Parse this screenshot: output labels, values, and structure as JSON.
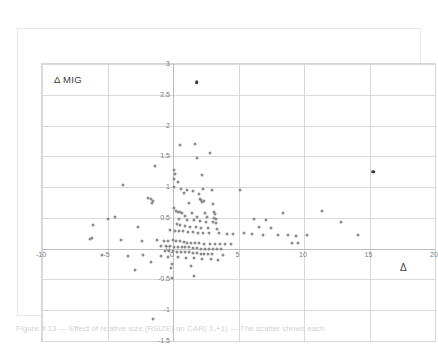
{
  "figure": {
    "caption": "Figure 4.13 — Effect of relative size (RSIZE) on CAR(-1,+1) — The scatter shows each"
  },
  "axes": {
    "y_title": "Δ MIG",
    "x_title": "Δ",
    "x_ticks": [
      "-10",
      "-5",
      "0",
      "5",
      "10",
      "15",
      "20"
    ],
    "y_ticks": [
      "3",
      "2.5",
      "2",
      "1.5",
      "1",
      "0.5",
      "0",
      "-0.5",
      "-1",
      "-1.5"
    ]
  },
  "chart_data": {
    "type": "scatter",
    "title": "",
    "xlabel": "Δ",
    "ylabel": "Δ MIG",
    "xlim": [
      -10,
      20
    ],
    "ylim": [
      -1.5,
      3
    ],
    "xticks": [
      -10,
      -5,
      0,
      5,
      10,
      15,
      20
    ],
    "yticks": [
      -1.5,
      -1,
      -0.5,
      0,
      0.5,
      1,
      1.5,
      2,
      2.5,
      3
    ],
    "grid": true,
    "legend": false,
    "marker_color": "#8c8c8c",
    "highlight_color": "#3a3a3a",
    "series": [
      {
        "name": "observations",
        "points": [
          [
            1.8,
            2.7
          ],
          [
            15.3,
            1.25
          ],
          [
            0.55,
            1.68
          ],
          [
            1.7,
            1.7
          ],
          [
            2.8,
            1.55
          ],
          [
            1.8,
            1.48
          ],
          [
            -1.4,
            1.35
          ],
          [
            0.1,
            1.28
          ],
          [
            0.15,
            1.22
          ],
          [
            0.1,
            1.13
          ],
          [
            2.2,
            1.2
          ],
          [
            0.4,
            1.08
          ],
          [
            -3.8,
            1.03
          ],
          [
            0.05,
            1.0
          ],
          [
            0.6,
            0.97
          ],
          [
            1.1,
            0.95
          ],
          [
            2.3,
            0.97
          ],
          [
            2.95,
            0.95
          ],
          [
            5.1,
            0.95
          ],
          [
            1.55,
            0.93
          ],
          [
            0.85,
            0.9
          ],
          [
            1.95,
            0.88
          ],
          [
            -1.9,
            0.82
          ],
          [
            -1.7,
            0.8
          ],
          [
            -1.55,
            0.78
          ],
          [
            -1.6,
            0.74
          ],
          [
            2.05,
            0.8
          ],
          [
            2.15,
            0.79
          ],
          [
            2.35,
            0.78
          ],
          [
            2.25,
            0.76
          ],
          [
            1.2,
            0.75
          ],
          [
            3.05,
            0.72
          ],
          [
            0.05,
            0.66
          ],
          [
            0.2,
            0.62
          ],
          [
            0.35,
            0.6
          ],
          [
            0.55,
            0.6
          ],
          [
            0.7,
            0.58
          ],
          [
            1.45,
            0.58
          ],
          [
            2.45,
            0.58
          ],
          [
            3.1,
            0.6
          ],
          [
            3.2,
            0.57
          ],
          [
            0.95,
            0.53
          ],
          [
            1.85,
            0.52
          ],
          [
            2.6,
            0.52
          ],
          [
            3.15,
            0.5
          ],
          [
            3.25,
            0.49
          ],
          [
            8.4,
            0.58
          ],
          [
            11.4,
            0.62
          ],
          [
            -4.4,
            0.52
          ],
          [
            -5.0,
            0.48
          ],
          [
            0.45,
            0.48
          ],
          [
            1.05,
            0.47
          ],
          [
            1.6,
            0.46
          ],
          [
            2.05,
            0.45
          ],
          [
            2.5,
            0.44
          ],
          [
            3.05,
            0.43
          ],
          [
            3.3,
            0.42
          ],
          [
            6.2,
            0.48
          ],
          [
            7.1,
            0.46
          ],
          [
            12.8,
            0.44
          ],
          [
            -6.1,
            0.38
          ],
          [
            -2.7,
            0.36
          ],
          [
            0.3,
            0.4
          ],
          [
            0.5,
            0.38
          ],
          [
            0.9,
            0.37
          ],
          [
            1.3,
            0.36
          ],
          [
            1.75,
            0.35
          ],
          [
            2.1,
            0.34
          ],
          [
            2.7,
            0.33
          ],
          [
            3.35,
            0.32
          ],
          [
            6.6,
            0.35
          ],
          [
            7.5,
            0.34
          ],
          [
            -0.2,
            0.3
          ],
          [
            0.15,
            0.29
          ],
          [
            0.45,
            0.28
          ],
          [
            0.8,
            0.28
          ],
          [
            1.15,
            0.27
          ],
          [
            1.5,
            0.27
          ],
          [
            1.9,
            0.26
          ],
          [
            2.3,
            0.26
          ],
          [
            2.75,
            0.25
          ],
          [
            3.5,
            0.25
          ],
          [
            4.1,
            0.24
          ],
          [
            4.6,
            0.24
          ],
          [
            5.4,
            0.25
          ],
          [
            6.0,
            0.24
          ],
          [
            6.9,
            0.23
          ],
          [
            8.0,
            0.22
          ],
          [
            8.8,
            0.22
          ],
          [
            9.4,
            0.21
          ],
          [
            10.2,
            0.22
          ],
          [
            14.1,
            0.22
          ],
          [
            -6.2,
            0.18
          ],
          [
            -6.35,
            0.16
          ],
          [
            -4.0,
            0.14
          ],
          [
            -2.4,
            0.12
          ],
          [
            -1.2,
            0.14
          ],
          [
            -0.7,
            0.12
          ],
          [
            -0.35,
            0.12
          ],
          [
            0.0,
            0.14
          ],
          [
            0.25,
            0.12
          ],
          [
            0.55,
            0.12
          ],
          [
            0.85,
            0.11
          ],
          [
            1.1,
            0.1
          ],
          [
            1.4,
            0.1
          ],
          [
            1.7,
            0.09
          ],
          [
            2.0,
            0.09
          ],
          [
            2.4,
            0.08
          ],
          [
            2.8,
            0.08
          ],
          [
            3.2,
            0.08
          ],
          [
            3.6,
            0.07
          ],
          [
            4.0,
            0.07
          ],
          [
            4.4,
            0.08
          ],
          [
            9.1,
            0.1
          ],
          [
            9.55,
            0.1
          ],
          [
            -0.95,
            0.05
          ],
          [
            -0.55,
            0.04
          ],
          [
            -0.25,
            0.04
          ],
          [
            0.05,
            0.03
          ],
          [
            0.35,
            0.03
          ],
          [
            0.65,
            0.02
          ],
          [
            0.95,
            0.02
          ],
          [
            1.25,
            0.02
          ],
          [
            1.55,
            0.01
          ],
          [
            1.85,
            0.01
          ],
          [
            2.15,
            0.0
          ],
          [
            2.45,
            0.0
          ],
          [
            2.75,
            0.0
          ],
          [
            3.05,
            0.0
          ],
          [
            3.35,
            -0.01
          ],
          [
            3.65,
            -0.01
          ],
          [
            -0.6,
            -0.03
          ],
          [
            -0.3,
            -0.04
          ],
          [
            0.0,
            -0.04
          ],
          [
            0.3,
            -0.05
          ],
          [
            0.6,
            -0.05
          ],
          [
            0.9,
            -0.06
          ],
          [
            1.2,
            -0.06
          ],
          [
            1.5,
            -0.07
          ],
          [
            1.8,
            -0.07
          ],
          [
            2.1,
            -0.08
          ],
          [
            2.4,
            -0.08
          ],
          [
            2.7,
            -0.08
          ],
          [
            3.0,
            -0.09
          ],
          [
            3.8,
            -0.1
          ],
          [
            -5.4,
            -0.1
          ],
          [
            -3.4,
            -0.12
          ],
          [
            -2.3,
            -0.1
          ],
          [
            -0.9,
            -0.12
          ],
          [
            -0.4,
            -0.14
          ],
          [
            0.4,
            -0.14
          ],
          [
            1.0,
            -0.15
          ],
          [
            1.6,
            -0.15
          ],
          [
            2.2,
            -0.16
          ],
          [
            2.9,
            -0.17
          ],
          [
            3.45,
            -0.18
          ],
          [
            -1.7,
            -0.22
          ],
          [
            -0.1,
            -0.25
          ],
          [
            1.35,
            -0.28
          ],
          [
            -0.15,
            -0.32
          ],
          [
            -2.9,
            -0.35
          ],
          [
            1.6,
            -0.45
          ],
          [
            -0.05,
            -0.48
          ],
          [
            -1.5,
            -1.15
          ]
        ]
      }
    ]
  }
}
